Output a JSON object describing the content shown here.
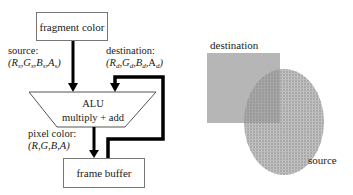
{
  "pipeline": {
    "fragment_box": {
      "label": "fragment color"
    },
    "source_label": {
      "title": "source:",
      "tuple": [
        "R",
        "s",
        "G",
        "s",
        "B",
        "s",
        "A",
        "s"
      ]
    },
    "destination_label": {
      "title": "destination:",
      "tuple": [
        "R",
        "d",
        "G",
        "d",
        "B",
        "d",
        "A",
        "d"
      ]
    },
    "alu": {
      "title": "ALU",
      "subtitle": "multiply + add"
    },
    "pixel_label": {
      "title": "pixel color:",
      "tuple": "(R,G,B,A)"
    },
    "frame_buffer_box": {
      "label": "frame buffer"
    }
  },
  "illustration": {
    "destination_label": "destination",
    "source_label": "source",
    "colors": {
      "destination_square": "#b4b4b4",
      "source_ellipse": "#a8a8a8",
      "overlap": "#8e8e8e"
    }
  }
}
